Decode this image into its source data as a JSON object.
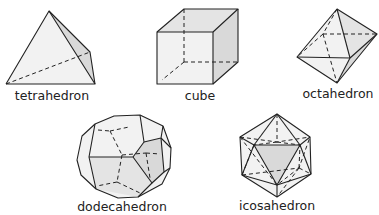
{
  "figure": {
    "shapes": [
      {
        "id": "tetrahedron",
        "label": "tetrahedron"
      },
      {
        "id": "cube",
        "label": "cube"
      },
      {
        "id": "octahedron",
        "label": "octahedron"
      },
      {
        "id": "dodecahedron",
        "label": "dodecahedron"
      },
      {
        "id": "icosahedron",
        "label": "icosahedron"
      }
    ]
  }
}
